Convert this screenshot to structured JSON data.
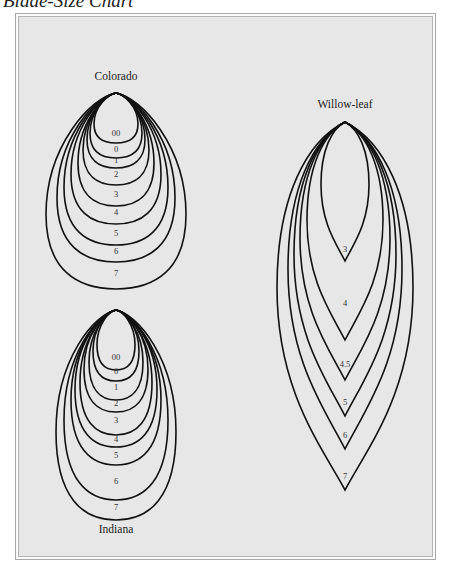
{
  "page": {
    "title": "Blade-Size Chart"
  },
  "colors": {
    "panel_background": "#e7e7e7",
    "outline": "#111111",
    "frame": "#a8a8a8"
  },
  "blade_groups": [
    {
      "id": "colorado",
      "label": "Colorado",
      "shape": "colorado",
      "sizes": [
        "00",
        "0",
        "1",
        "2",
        "3",
        "4",
        "5",
        "6",
        "7"
      ]
    },
    {
      "id": "indiana",
      "label": "Indiana",
      "shape": "indiana",
      "sizes": [
        "00",
        "0",
        "1",
        "2",
        "3",
        "4",
        "5",
        "6",
        "7"
      ]
    },
    {
      "id": "willow-leaf",
      "label": "Willow-leaf",
      "shape": "willow",
      "sizes": [
        "3",
        "4",
        "4.5",
        "5",
        "6",
        "7"
      ]
    }
  ]
}
